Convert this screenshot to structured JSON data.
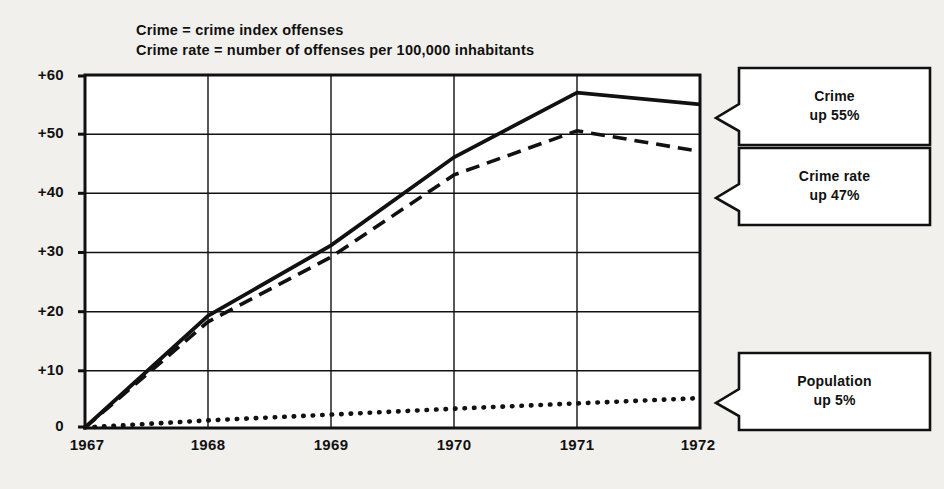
{
  "legend": {
    "lines": [
      "Crime = crime index offenses",
      "Crime rate = number of offenses per 100,000 inhabitants"
    ]
  },
  "chart_data": {
    "type": "line",
    "title": "",
    "subtitle": "",
    "xlabel": "",
    "ylabel": "",
    "x": [
      "1967",
      "1968",
      "1969",
      "1970",
      "1971",
      "1972"
    ],
    "xtick_labels": [
      "1967",
      "1968",
      "1969",
      "1970",
      "1971",
      "1972"
    ],
    "ytick_labels": [
      "+60",
      "+50",
      "+40",
      "+30",
      "+20",
      "+10",
      "0"
    ],
    "ytick_values": [
      60,
      50,
      40,
      30,
      20,
      10,
      0
    ],
    "ylim": [
      0,
      60
    ],
    "grid": true,
    "legend_position": "none",
    "series": [
      {
        "name": "Crime",
        "style": "solid",
        "color": "#111111",
        "values": [
          0,
          19,
          31,
          46,
          57,
          55
        ]
      },
      {
        "name": "Crime rate",
        "style": "dashed",
        "color": "#111111",
        "values": [
          0,
          18,
          29,
          43,
          50.5,
          47
        ]
      },
      {
        "name": "Population",
        "style": "dotted",
        "color": "#111111",
        "values": [
          0,
          1.2,
          2.2,
          3.2,
          4.1,
          5
        ]
      }
    ],
    "annotations": [
      {
        "id": "crime",
        "line1": "Crime",
        "line2": "up 55%",
        "series": "Crime"
      },
      {
        "id": "crime-rate",
        "line1": "Crime rate",
        "line2": "up 47%",
        "series": "Crime rate"
      },
      {
        "id": "population",
        "line1": "Population",
        "line2": "up 5%",
        "series": "Population"
      }
    ]
  },
  "callouts": {
    "crime": {
      "line1": "Crime",
      "line2": "up 55%"
    },
    "crime_rate": {
      "line1": "Crime rate",
      "line2": "up 47%"
    },
    "population": {
      "line1": "Population",
      "line2": "up 5%"
    }
  }
}
